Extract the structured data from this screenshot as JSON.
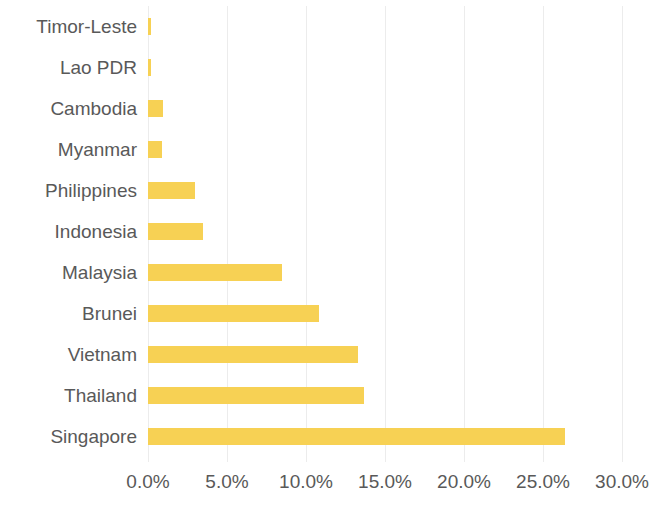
{
  "chart_data": {
    "type": "bar",
    "orientation": "horizontal",
    "title": "",
    "subtitle": "",
    "xlabel": "",
    "ylabel": "",
    "categories": [
      "Timor-Leste",
      "Lao PDR",
      "Cambodia",
      "Myanmar",
      "Philippines",
      "Indonesia",
      "Malaysia",
      "Brunei",
      "Vietnam",
      "Thailand",
      "Singapore"
    ],
    "values": [
      0.2,
      0.2,
      0.95,
      0.9,
      3.0,
      3.5,
      8.5,
      10.8,
      13.3,
      13.7,
      26.4
    ],
    "value_unit": "%",
    "xlim": [
      0,
      30
    ],
    "xticks": [
      0,
      5,
      10,
      15,
      20,
      25,
      30
    ],
    "xtick_labels": [
      "0.0%",
      "5.0%",
      "10.0%",
      "15.0%",
      "20.0%",
      "25.0%",
      "30.0%"
    ],
    "grid": true,
    "grid_axis": "x",
    "legend": false,
    "legend_position": "none",
    "bar_color": "#f7d154",
    "gridline_color": "#ececec",
    "text_color": "#595959",
    "background_color": "#ffffff"
  }
}
